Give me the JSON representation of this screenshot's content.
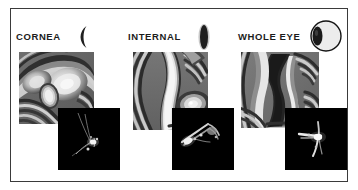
{
  "figure": {
    "background_color": "#ffffff",
    "border_color": "#3a3a3a",
    "label_color": "#1c1c1c"
  },
  "panels": [
    {
      "id": "cornea",
      "label": "CORNEA",
      "icon_name": "cornea-crescent-icon",
      "icon_type": "crescent",
      "wavefront_map_name": "cornea-wavefront-map",
      "psf_name": "cornea-point-spread-function"
    },
    {
      "id": "internal",
      "label": "INTERNAL",
      "icon_name": "lens-ellipse-icon",
      "icon_type": "lens",
      "wavefront_map_name": "internal-wavefront-map",
      "psf_name": "internal-point-spread-function"
    },
    {
      "id": "whole-eye",
      "label": "WHOLE EYE",
      "icon_name": "eyeball-icon",
      "icon_type": "eyeball",
      "wavefront_map_name": "whole-eye-wavefront-map",
      "psf_name": "whole-eye-point-spread-function"
    }
  ]
}
